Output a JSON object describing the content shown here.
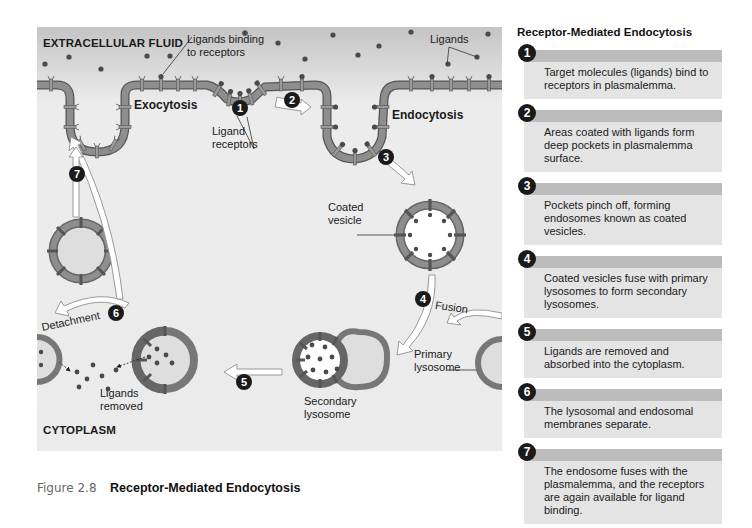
{
  "diagram": {
    "regions": {
      "top": "EXTRACELLULAR FLUID",
      "bottom": "CYTOPLASM"
    },
    "labels": {
      "ligands_binding": "Ligands binding\nto receptors",
      "ligands": "Ligands",
      "exocytosis": "Exocytosis",
      "endocytosis": "Endocytosis",
      "ligand_receptors": "Ligand\nreceptors",
      "coated_vesicle": "Coated\nvesicle",
      "fusion": "Fusion",
      "primary_lysosome": "Primary\nlysosome",
      "secondary_lysosome": "Secondary\nlysosome",
      "detachment": "Detachment",
      "ligands_removed": "Ligands\nremoved"
    },
    "step_markers": [
      "1",
      "2",
      "3",
      "4",
      "5",
      "6",
      "7"
    ]
  },
  "caption": {
    "number": "Figure 2.8",
    "title": "Receptor-Mediated Endocytosis"
  },
  "panel": {
    "title": "Receptor-Mediated Endocytosis",
    "steps": [
      {
        "num": "1",
        "text": "Target molecules (ligands) bind to receptors in plasmalemma."
      },
      {
        "num": "2",
        "text": "Areas coated with ligands form deep pockets in plasmalemma surface."
      },
      {
        "num": "3",
        "text": "Pockets pinch off, forming endosomes known as coated vesicles."
      },
      {
        "num": "4",
        "text": "Coated vesicles fuse with primary lysosomes to form secondary lysosomes."
      },
      {
        "num": "5",
        "text": "Ligands are removed and absorbed into the cytoplasm."
      },
      {
        "num": "6",
        "text": "The lysosomal and endosomal membranes separate."
      },
      {
        "num": "7",
        "text": "The endosome fuses with the plasmalemma, and the receptors are again available for ligand binding."
      }
    ]
  },
  "colors": {
    "membrane": "#8a8a8a",
    "membrane_edge": "#555555",
    "ligand": "#4a4a4a",
    "marker": "#1a1a1a",
    "box_head": "#bcbcbc",
    "box_body": "#e4e4e4"
  }
}
